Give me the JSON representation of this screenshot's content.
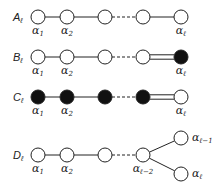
{
  "diagrams": [
    {
      "name": "A",
      "label_main": "A",
      "label_sub": "ℓ",
      "y": 17,
      "nodes": [
        {
          "x": 38,
          "fill": "open",
          "label": "α",
          "sub": "1"
        },
        {
          "x": 67,
          "fill": "open",
          "label": "α",
          "sub": "2"
        },
        {
          "x": 105,
          "fill": "open",
          "label": "",
          "sub": ""
        },
        {
          "x": 143,
          "fill": "open",
          "label": "",
          "sub": ""
        },
        {
          "x": 181,
          "fill": "open",
          "label": "α",
          "sub": "ℓ"
        }
      ],
      "edges": [
        "single",
        "single",
        "dashed",
        "single"
      ]
    },
    {
      "name": "B",
      "label_main": "B",
      "label_sub": "ℓ",
      "y": 57,
      "nodes": [
        {
          "x": 38,
          "fill": "open",
          "label": "α",
          "sub": "1"
        },
        {
          "x": 67,
          "fill": "open",
          "label": "α",
          "sub": "2"
        },
        {
          "x": 105,
          "fill": "open",
          "label": "",
          "sub": ""
        },
        {
          "x": 143,
          "fill": "open",
          "label": "",
          "sub": ""
        },
        {
          "x": 181,
          "fill": "filled",
          "label": "α",
          "sub": "ℓ"
        }
      ],
      "edges": [
        "single",
        "single",
        "dashed",
        "double"
      ]
    },
    {
      "name": "C",
      "label_main": "C",
      "label_sub": "ℓ",
      "y": 97,
      "nodes": [
        {
          "x": 38,
          "fill": "filled",
          "label": "α",
          "sub": "1"
        },
        {
          "x": 67,
          "fill": "filled",
          "label": "α",
          "sub": "2"
        },
        {
          "x": 105,
          "fill": "filled",
          "label": "",
          "sub": ""
        },
        {
          "x": 143,
          "fill": "filled",
          "label": "",
          "sub": ""
        },
        {
          "x": 181,
          "fill": "open",
          "label": "α",
          "sub": "ℓ"
        }
      ],
      "edges": [
        "single",
        "single",
        "dashed",
        "double"
      ]
    },
    {
      "name": "D",
      "label_main": "D",
      "label_sub": "ℓ",
      "y": 155,
      "nodes": [
        {
          "x": 38,
          "fill": "open",
          "label": "α",
          "sub": "1"
        },
        {
          "x": 67,
          "fill": "open",
          "label": "α",
          "sub": "2"
        },
        {
          "x": 105,
          "fill": "open",
          "label": "",
          "sub": ""
        },
        {
          "x": 143,
          "fill": "open",
          "label": "α",
          "sub": "ℓ−2"
        }
      ],
      "branches": [
        {
          "x": 181,
          "y": 138,
          "fill": "open",
          "label": "α",
          "sub": "ℓ−1"
        },
        {
          "x": 181,
          "y": 174,
          "fill": "open",
          "label": "α",
          "sub": "ℓ"
        }
      ],
      "edges": [
        "single",
        "single",
        "dashed"
      ]
    }
  ],
  "colors": {
    "stroke": "#222222",
    "filled": "#111111",
    "open": "#ffffff"
  }
}
